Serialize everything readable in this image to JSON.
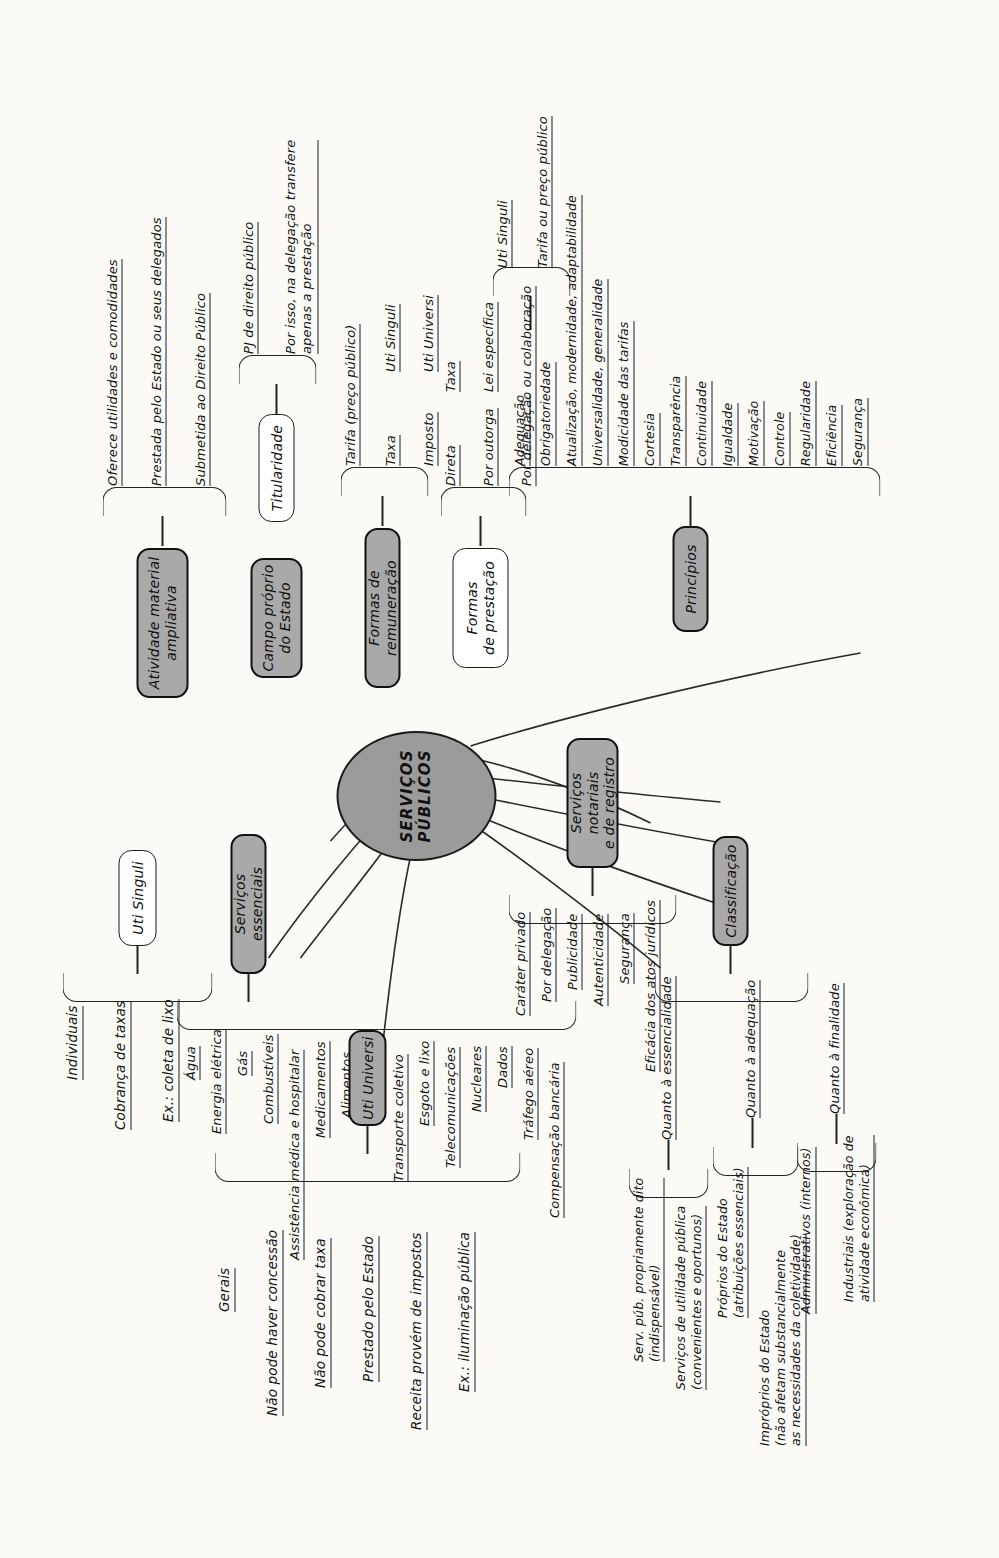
{
  "map": {
    "title": "SERVIÇOS PÚBLICOS",
    "center": {
      "label": "SERVIÇOS PÚBLICOS"
    },
    "colors": {
      "filled_node": "#a9a9a9",
      "center_node": "#9b9b9b",
      "line": "#232323",
      "page": "#fbfaf7"
    },
    "branches": {
      "uti_universi": {
        "label": "Uti Universi",
        "style": "filled",
        "group_label": "Gerais",
        "items": [
          "Gerais",
          "Não pode haver concessão",
          "Não pode cobrar taxa",
          "Prestado pelo Estado",
          "Receita provém de impostos",
          "Ex.: iluminação pública"
        ]
      },
      "uti_singuli": {
        "label": "Uti Singuli",
        "style": "plain",
        "items": [
          "Individuais",
          "Cobrança de taxas",
          "Ex.: coleta de lixo"
        ]
      },
      "servicos_essenciais": {
        "label": "Serviços essenciais",
        "style": "filled",
        "items": [
          "Água",
          "Energia elétrica",
          "Gás",
          "Combustíveis",
          "Assistência médica e hospitalar",
          "Medicamentos",
          "Alimentos",
          "Funerários",
          "Transporte coletivo",
          "Esgoto e lixo",
          "Telecomunicações",
          "Nucleares",
          "Dados",
          "Tráfego aéreo",
          "Compensação bancária"
        ]
      },
      "servicos_notariais": {
        "label": "Serviços notariais\ne de registro",
        "style": "filled",
        "items": [
          "Caráter privado",
          "Por delegação",
          "Publicidade",
          "Autenticidade",
          "Segurança",
          "Eficácia dos atos jurídicos"
        ]
      },
      "classificacao": {
        "label": "Classificação",
        "style": "filled",
        "subgroups": [
          {
            "label": "Quanto à essencialidade",
            "items": [
              "Serv. púb. propriamente dito\n(indispensável)",
              "Serviços de utilidade pública\n(convenientes e oportunos)"
            ]
          },
          {
            "label": "Quanto à adequação",
            "items": [
              "Próprios do Estado\n(atribuições essenciais)",
              "Impróprios do Estado\n(não afetam substancialmente\nas necessidades da coletividade)"
            ]
          },
          {
            "label": "Quanto à finalidade",
            "items": [
              "Administrativos (internos)",
              "Industriais (exploração de\natividade econômica)"
            ]
          }
        ]
      },
      "atividade_material": {
        "label": "Atividade material\nampliativa",
        "style": "filled",
        "items": [
          "Oferece utilidades e comodidades",
          "Prestada pelo Estado ou seus delegados",
          "Submetida ao Direito Público"
        ]
      },
      "campo_proprio": {
        "label": "Campo próprio\ndo Estado",
        "style": "filled",
        "children": [
          {
            "label": "Titularidade",
            "style": "plain",
            "items": [
              "PJ de direito público",
              "Por isso, na delegação transfere\napenas a prestação"
            ]
          }
        ]
      },
      "formas_remuneracao": {
        "label": "Formas de remuneração",
        "style": "filled",
        "items": [
          "Tarifa (preço público)",
          "Taxa",
          "Imposto"
        ],
        "annotations": [
          "Uti Singuli",
          "Uti Singuli",
          "Uti Universi"
        ]
      },
      "formas_prestacao": {
        "label": "Formas\nde prestação",
        "style": "plain",
        "items": [
          "Direta",
          "Por outorga",
          "Por delegação ou colaboração"
        ],
        "annotations": [
          "Taxa",
          "Lei específica",
          "Uti Singuli",
          "Tarifa ou preço público"
        ]
      },
      "principios": {
        "label": "Princípios",
        "style": "filled",
        "items": [
          "Adequação",
          "Obrigatoriedade",
          "Atualização, modernidade, adaptabilidade",
          "Universalidade, generalidade",
          "Modicidade das tarifas",
          "Cortesia",
          "Transparência",
          "Continuidade",
          "Igualdade",
          "Motivação",
          "Controle",
          "Regularidade",
          "Eficiência",
          "Segurança"
        ]
      }
    }
  }
}
